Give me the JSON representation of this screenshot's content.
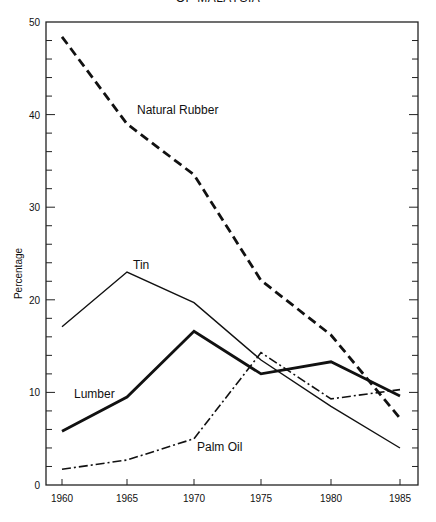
{
  "title": "OF MALAYSIA",
  "chart_data": {
    "type": "line",
    "title": "OF MALAYSIA",
    "xlabel": "",
    "ylabel": "Percentage",
    "x": [
      1960,
      1965,
      1970,
      1975,
      1980,
      1985
    ],
    "xticks": [
      "1960",
      "1965",
      "1970",
      "1975",
      "1980",
      "1985"
    ],
    "yticks": [
      "0",
      "10",
      "20",
      "30",
      "40",
      "50"
    ],
    "ylim": [
      0,
      50
    ],
    "grid": false,
    "legend": "inline labels",
    "series": [
      {
        "name": "Natural Rubber",
        "style": "dashed",
        "values": [
          48.4,
          39.0,
          33.5,
          22.1,
          16.2,
          7.2
        ]
      },
      {
        "name": "Tin",
        "style": "solid-thin",
        "values": [
          17.1,
          23.0,
          19.7,
          13.5,
          8.5,
          4.0
        ]
      },
      {
        "name": "Lumber",
        "style": "solid-thick",
        "values": [
          5.8,
          9.5,
          16.6,
          12.0,
          13.3,
          9.6
        ]
      },
      {
        "name": "Palm Oil",
        "style": "dash-dot",
        "values": [
          1.7,
          2.7,
          5.0,
          14.3,
          9.3,
          10.3
        ]
      }
    ]
  }
}
